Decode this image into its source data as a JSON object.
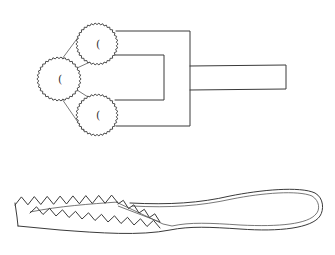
{
  "figure": {
    "colors": {
      "background": "#ffffff",
      "stroke": "#3a3a3a"
    },
    "top_tool": {
      "gears": [
        {
          "id": "top",
          "cx": 97,
          "cy": 44,
          "r": 20,
          "label": "("
        },
        {
          "id": "left",
          "cx": 59,
          "cy": 79,
          "r": 21,
          "label": "("
        },
        {
          "id": "bottom",
          "cx": 97,
          "cy": 115,
          "r": 20,
          "label": "("
        }
      ],
      "outer_bracket": {
        "x1": 117,
        "top": 31,
        "right": 190,
        "bottom": 126
      },
      "inner_bracket": {
        "x1": 116,
        "top": 55,
        "right": 164,
        "bottom": 100
      },
      "handle": {
        "x1": 190,
        "x2": 286,
        "top": 66,
        "bottom": 89
      }
    },
    "bottom_tool": {
      "name": "serrated-tongs",
      "jaw_x_range": [
        15,
        165
      ],
      "loop_x_range": [
        165,
        322
      ]
    }
  }
}
